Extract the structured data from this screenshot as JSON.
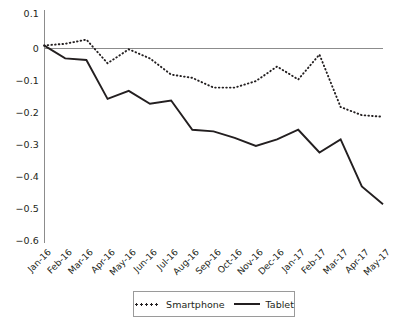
{
  "chart_data": {
    "type": "line",
    "title": "",
    "xlabel": "",
    "ylabel": "",
    "ylim": [
      -0.6,
      0.1
    ],
    "yticks": [
      0.1,
      0,
      -0.1,
      -0.2,
      -0.3,
      -0.4,
      -0.5,
      -0.6
    ],
    "ytick_labels": [
      "0.1",
      "0",
      "−0.1",
      "−0.2",
      "−0.3",
      "−0.4",
      "−0.5",
      "−0.6"
    ],
    "grid": false,
    "zero_line": true,
    "legend_position": "bottom-center",
    "categories": [
      "Jan-16",
      "Feb-16",
      "Mar-16",
      "Apr-16",
      "May-16",
      "Jun-16",
      "Jul-16",
      "Aug-16",
      "Sep-16",
      "Oct-16",
      "Nov-16",
      "Dec-16",
      "Jan-17",
      "Feb-17",
      "Mar-17",
      "Apr-17",
      "May-17"
    ],
    "series": [
      {
        "name": "Smartphone",
        "style": "dotted",
        "color": "#231f20",
        "values": [
          0,
          0.005,
          0.018,
          -0.055,
          -0.012,
          -0.04,
          -0.09,
          -0.1,
          -0.13,
          -0.13,
          -0.11,
          -0.065,
          -0.105,
          -0.028,
          -0.19,
          -0.215,
          -0.22
        ]
      },
      {
        "name": "Tablet",
        "style": "solid",
        "color": "#231f20",
        "values": [
          0,
          -0.04,
          -0.045,
          -0.165,
          -0.14,
          -0.18,
          -0.17,
          -0.26,
          -0.265,
          -0.285,
          -0.31,
          -0.29,
          -0.26,
          -0.33,
          -0.29,
          -0.435,
          -0.49
        ]
      }
    ]
  },
  "legend": {
    "items": [
      {
        "label": "Smartphone",
        "marker": "dotted-line-swatch"
      },
      {
        "label": "Tablet",
        "marker": "solid-line-swatch"
      }
    ]
  },
  "colors": {
    "ink": "#231f20",
    "axis": "#8c8c8c",
    "background": "#ffffff"
  }
}
